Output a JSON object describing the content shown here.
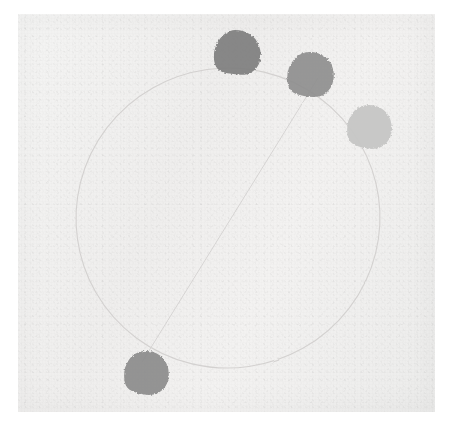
{
  "figure": {
    "canvas": {
      "width": 453,
      "height": 426
    },
    "background_color": "#f2f2f1",
    "page_color": "#ffffff",
    "medium": "scanned paper with grain texture"
  },
  "chart_data": {
    "type": "scatter",
    "subtitle": "",
    "xlabel": "",
    "ylabel": "",
    "grid": false,
    "legend_position": "none",
    "axis_visible": false,
    "tick_labels": [],
    "annotations": [],
    "orbit": {
      "name": "orbit-ellipse",
      "shape": "ellipse",
      "center_x": 228,
      "center_y": 218,
      "radius_x": 152,
      "radius_y": 150,
      "rotation_deg": -8,
      "stroke_color": "#d2d0cf",
      "stroke_width": 1.1
    },
    "axis_line": {
      "name": "apsides-line",
      "shape": "line",
      "x1": 318,
      "y1": 78,
      "x2": 142,
      "y2": 362,
      "stroke_color": "#d5d3d2",
      "stroke_width": 1.0
    },
    "points": [
      {
        "label": "body-1",
        "x": 235,
        "y": 51,
        "radius": 21,
        "color": "#7e7e7e",
        "tone": "dark"
      },
      {
        "label": "body-2",
        "x": 309,
        "y": 73,
        "radius": 21,
        "color": "#8d8d8d",
        "tone": "medium-dark"
      },
      {
        "label": "body-3",
        "x": 369,
        "y": 125,
        "radius": 20,
        "color": "#c6c6c5",
        "tone": "light"
      },
      {
        "label": "body-4",
        "x": 146,
        "y": 371,
        "radius": 20,
        "color": "#8a8a8a",
        "tone": "medium-dark"
      }
    ]
  }
}
